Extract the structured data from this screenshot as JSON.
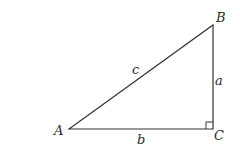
{
  "diagram": {
    "type": "right-triangle",
    "vertices": [
      {
        "name": "A",
        "label": "A"
      },
      {
        "name": "B",
        "label": "B"
      },
      {
        "name": "C",
        "label": "C"
      }
    ],
    "sides": [
      {
        "name": "a",
        "label": "a",
        "between": "B-C"
      },
      {
        "name": "b",
        "label": "b",
        "between": "A-C"
      },
      {
        "name": "c",
        "label": "c",
        "between": "A-B"
      }
    ],
    "right_angle_at": "C",
    "colors": {
      "stroke": "#333333",
      "text": "#2a2a2a",
      "background": "#ffffff"
    }
  }
}
